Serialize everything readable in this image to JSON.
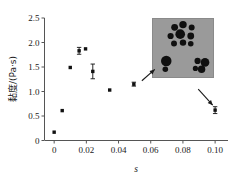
{
  "chart_data": {
    "type": "scatter",
    "title": "",
    "xlabel": "s",
    "ylabel": "黏度/(Pa·s)",
    "xlim": [
      -0.006,
      0.108
    ],
    "ylim": [
      0,
      2.5
    ],
    "xticks": [
      0,
      0.02,
      0.04,
      0.06,
      0.08,
      0.1
    ],
    "xticklabels": [
      "0",
      "0.02",
      "0.04",
      "0.06",
      "0.08",
      "0.10"
    ],
    "yticks": [
      0,
      0.5,
      1.0,
      1.5,
      2.0,
      2.5
    ],
    "yticklabels": [
      "0",
      "0.5",
      "1.0",
      "1.5",
      "2.0",
      "2.5"
    ],
    "grid": false,
    "legend": null,
    "marker": "square",
    "marker_color": "#111111",
    "series": [
      {
        "name": "黏度",
        "points": [
          {
            "x": 0.0,
            "y": 0.17,
            "yerr": 0.0
          },
          {
            "x": 0.005,
            "y": 0.61,
            "yerr": 0.0
          },
          {
            "x": 0.01,
            "y": 1.49,
            "yerr": 0.0
          },
          {
            "x": 0.0155,
            "y": 1.83,
            "yerr": 0.07
          },
          {
            "x": 0.0195,
            "y": 1.87,
            "yerr": 0.0
          },
          {
            "x": 0.024,
            "y": 1.41,
            "yerr": 0.15
          },
          {
            "x": 0.0345,
            "y": 1.03,
            "yerr": 0.0
          },
          {
            "x": 0.0495,
            "y": 1.15,
            "yerr": 0.04
          },
          {
            "x": 0.1,
            "y": 0.62,
            "yerr": 0.07
          }
        ]
      }
    ],
    "annotations": [
      {
        "name": "arrow-to-inset-left",
        "from": {
          "x": 0.0545,
          "y": 1.22
        },
        "to": {
          "x": 0.0625,
          "y": 1.45
        }
      },
      {
        "name": "arrow-inset-to-last-point",
        "from": {
          "x": 0.0895,
          "y": 1.05
        },
        "to": {
          "x": 0.0985,
          "y": 0.72
        }
      }
    ],
    "inset": {
      "name": "micrograph-inset",
      "description": "gray optical micrograph showing black circular droplet clusters",
      "background_color": "#9a9a9a",
      "particle_color": "#101010",
      "bounds_px": {
        "x": 152,
        "y": 18,
        "width": 62,
        "height": 60
      },
      "particles": [
        {
          "cx": 0.365,
          "cy": 0.155,
          "r": 0.055
        },
        {
          "cx": 0.5,
          "cy": 0.11,
          "r": 0.06
        },
        {
          "cx": 0.64,
          "cy": 0.16,
          "r": 0.048
        },
        {
          "cx": 0.3,
          "cy": 0.3,
          "r": 0.05
        },
        {
          "cx": 0.455,
          "cy": 0.27,
          "r": 0.078
        },
        {
          "cx": 0.625,
          "cy": 0.3,
          "r": 0.055
        },
        {
          "cx": 0.355,
          "cy": 0.425,
          "r": 0.048
        },
        {
          "cx": 0.5,
          "cy": 0.41,
          "r": 0.052
        },
        {
          "cx": 0.625,
          "cy": 0.43,
          "r": 0.045
        },
        {
          "cx": 0.23,
          "cy": 0.715,
          "r": 0.085
        },
        {
          "cx": 0.215,
          "cy": 0.855,
          "r": 0.045
        },
        {
          "cx": 0.735,
          "cy": 0.715,
          "r": 0.05
        },
        {
          "cx": 0.855,
          "cy": 0.74,
          "r": 0.07
        },
        {
          "cx": 0.7,
          "cy": 0.84,
          "r": 0.042
        },
        {
          "cx": 0.8,
          "cy": 0.855,
          "r": 0.06
        }
      ]
    }
  },
  "axes": {
    "x_title": "s",
    "y_title": "黏度/(Pa·s)"
  }
}
